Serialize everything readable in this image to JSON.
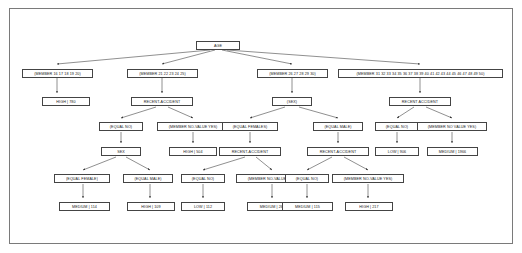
{
  "diagram": {
    "frame_color": "#7a7a7a",
    "node_border_color": "#444444",
    "node_fill": "#ffffff",
    "edge_color": "#333333",
    "background": "#ffffff"
  },
  "nodes": {
    "root": {
      "label": "AGE"
    },
    "level2": [
      {
        "label": "(MEMBER 16 17 18 19 20)"
      },
      {
        "label": "(MEMBER 21 22 23 24 25)"
      },
      {
        "label": "(MEMBER 26 27 28 29 30)"
      },
      {
        "label": "(MEMBER 31 32 33 34 35 36 37 38 39 40 41 42 43 44 45 46 47 48 49 50)"
      }
    ],
    "level3": [
      {
        "label": "HIGH | 780"
      },
      {
        "label": "RECENT-ACCIDENT"
      },
      {
        "label": "(SEX)"
      },
      {
        "label": "RECENT ACCIDENT"
      }
    ],
    "level4": [
      {
        "label": "(EQUAL NO)"
      },
      {
        "label": "(MEMBER NO-VALUE YES)"
      },
      {
        "label": "(EQUAL FEMALES)"
      },
      {
        "label": "(EQUAL MALE)"
      },
      {
        "label": "(EQUAL NO)"
      },
      {
        "label": "(MEMBER NO VALUE YES)"
      }
    ],
    "level5": [
      {
        "label": "SEX"
      },
      {
        "label": "HIGH | 504"
      },
      {
        "label": "RECENT-ACCIDENT"
      },
      {
        "label": "RECENT-ACCIDENT"
      },
      {
        "label": "LOW | 906"
      },
      {
        "label": "MEDIUM | 1966"
      }
    ],
    "level6": [
      {
        "label": "(EQUAL FEMALE)"
      },
      {
        "label": "(EQUAL MALE)"
      },
      {
        "label": "(EQUAL NO)"
      },
      {
        "label": "(MEMBER NO-VALUE YES)"
      },
      {
        "label": "(EQUAL NO)"
      },
      {
        "label": "(MEMBER NO-VALUE YES)"
      }
    ],
    "level7": [
      {
        "label": "MEDIUM | 114"
      },
      {
        "label": "HIGH | 109"
      },
      {
        "label": "LOW | 112"
      },
      {
        "label": "MEDIUM | 261"
      },
      {
        "label": "MEDIUM | 115"
      },
      {
        "label": "HIGH | 217"
      }
    ]
  }
}
